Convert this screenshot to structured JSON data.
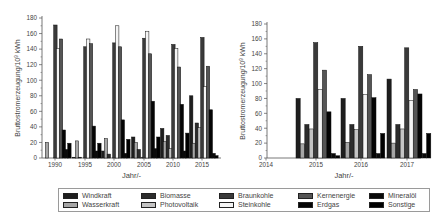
{
  "chart_data": [
    {
      "type": "bar",
      "title": "",
      "xlabel": "Jahr/-",
      "ylabel": "Bruttostromerzeugung/10^9 kWh",
      "ylim": [
        0,
        180
      ],
      "yticks": [
        0,
        20,
        40,
        60,
        80,
        100,
        120,
        140,
        160,
        180
      ],
      "categories": [
        "1990",
        "1995",
        "2000",
        "2005",
        "2010",
        "2015"
      ],
      "grid": false,
      "series": [
        {
          "name": "Windkraft",
          "values": [
            0,
            1,
            9,
            27,
            38,
            80
          ]
        },
        {
          "name": "Wasserkraft",
          "values": [
            20,
            22,
            25,
            20,
            21,
            19
          ]
        },
        {
          "name": "Biomasse",
          "values": [
            0,
            1,
            5,
            11,
            29,
            45
          ]
        },
        {
          "name": "Photovoltaik",
          "values": [
            0,
            0,
            0,
            1,
            12,
            39
          ]
        },
        {
          "name": "Braunkohle",
          "values": [
            171,
            143,
            148,
            154,
            146,
            155
          ]
        },
        {
          "name": "Steinkohle",
          "values": [
            141,
            153,
            170,
            163,
            141,
            92
          ]
        },
        {
          "name": "Kernenergie",
          "values": [
            153,
            147,
            143,
            134,
            117,
            118
          ]
        },
        {
          "name": "Erdgas",
          "values": [
            36,
            41,
            49,
            73,
            69,
            62
          ]
        },
        {
          "name": "Mineralöl",
          "values": [
            11,
            9,
            6,
            12,
            9,
            6
          ]
        },
        {
          "name": "Sonstige",
          "values": [
            19,
            19,
            24,
            27,
            32,
            3
          ]
        }
      ]
    },
    {
      "type": "bar",
      "title": "",
      "xlabel": "Jahr/-",
      "ylabel": "Bruttostromerzeugung/10^9 kWh",
      "ylim": [
        0,
        180
      ],
      "yticks": [
        0,
        20,
        40,
        60,
        80,
        100,
        120,
        140,
        160,
        180
      ],
      "categories": [
        "2015",
        "2016",
        "2017"
      ],
      "xticks": [
        "2014",
        "2015",
        "2016",
        "2017"
      ],
      "grid": false,
      "series": [
        {
          "name": "Windkraft",
          "values": [
            80,
            80,
            106
          ]
        },
        {
          "name": "Wasserkraft",
          "values": [
            19,
            21,
            20
          ]
        },
        {
          "name": "Biomasse",
          "values": [
            45,
            45,
            45
          ]
        },
        {
          "name": "Photovoltaik",
          "values": [
            39,
            38,
            39
          ]
        },
        {
          "name": "Braunkohle",
          "values": [
            155,
            150,
            148
          ]
        },
        {
          "name": "Steinkohle",
          "values": [
            92,
            85,
            77
          ]
        },
        {
          "name": "Kernenergie",
          "values": [
            118,
            112,
            92
          ]
        },
        {
          "name": "Erdgas",
          "values": [
            62,
            81,
            86
          ]
        },
        {
          "name": "Mineralöl",
          "values": [
            6,
            6,
            6
          ]
        },
        {
          "name": "Sonstige",
          "values": [
            3,
            33,
            33
          ]
        }
      ]
    }
  ],
  "legend": {
    "items": [
      {
        "label": "Windkraft",
        "color": "#1e1e1e"
      },
      {
        "label": "Biomasse",
        "color": "#2c2c2c"
      },
      {
        "label": "Braunkohle",
        "color": "#3a3a3a"
      },
      {
        "label": "Kernenergie",
        "color": "#555555"
      },
      {
        "label": "Mineralöl",
        "color": "#0a0a0a"
      },
      {
        "label": "Wasserkraft",
        "color": "#a6a6a6"
      },
      {
        "label": "Photovoltaik",
        "color": "#c4c4c4"
      },
      {
        "label": "Steinkohle",
        "color": "#f4f4f4"
      },
      {
        "label": "Erdgas",
        "color": "#050505"
      },
      {
        "label": "Sonstige",
        "color": "#000000"
      }
    ]
  },
  "axes": {
    "left": {
      "ylabel_main": "Bruttostromerzeugung/10",
      "ylabel_exp": "9",
      "ylabel_unit": " kWh",
      "xlabel": "Jahr/-"
    },
    "right": {
      "ylabel_main": "Bruttostromerzeugung/10",
      "ylabel_exp": "9",
      "ylabel_unit": " kWh",
      "xlabel": "Jahr/-"
    }
  }
}
